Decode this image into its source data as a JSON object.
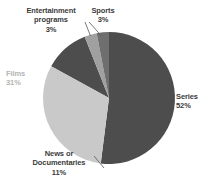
{
  "chart_data": {
    "type": "pie",
    "title": "",
    "categories": [
      "Series",
      "Films",
      "News or Documentaries",
      "Entertainment programs",
      "Sports"
    ],
    "values": [
      52,
      31,
      11,
      3,
      3
    ],
    "value_suffix": "%",
    "colors": [
      "#4d4d4d",
      "#c9c9c9",
      "#4d4d4d",
      "#a0a0a0",
      "#6f6f6f"
    ],
    "legend": "none",
    "grid": false,
    "start_angle_deg": 0,
    "direction": "clockwise"
  },
  "labels": {
    "entertainment": {
      "name": "Entertainment programs",
      "line1": "Entertainment",
      "line2": "programs",
      "value": "3%"
    },
    "sports": {
      "name": "Sports",
      "line1": "Sports",
      "value": "3%"
    },
    "films": {
      "name": "Films",
      "line1": "Films",
      "value": "31%"
    },
    "series": {
      "name": "Series",
      "line1": "Series",
      "value": "52%"
    },
    "news": {
      "name": "News or Documentaries",
      "line1": "News or",
      "line2": "Documentaries",
      "value": "11%"
    }
  }
}
